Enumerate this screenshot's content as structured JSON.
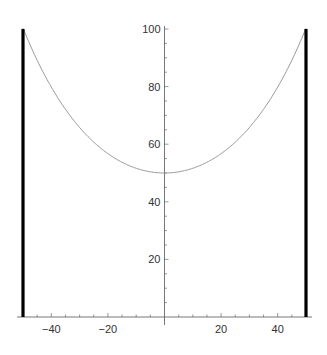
{
  "chart_data": {
    "type": "line",
    "title": "",
    "xlabel": "",
    "ylabel": "",
    "xlim": [
      -50,
      50
    ],
    "ylim": [
      0,
      100
    ],
    "grid": false,
    "x_ticks": [
      -40,
      -20,
      20,
      40
    ],
    "x_tick_labels": [
      "−40",
      "−20",
      "20",
      "40"
    ],
    "y_ticks": [
      20,
      40,
      60,
      80,
      100
    ],
    "y_tick_labels": [
      "20",
      "40",
      "60",
      "80",
      "100"
    ],
    "series": [
      {
        "name": "hanging cable (catenary)",
        "color": "#9a9a9a",
        "x": [
          -50,
          -40,
          -30,
          -25,
          -20,
          -10,
          0,
          10,
          20,
          25,
          30,
          40,
          50
        ],
        "y": [
          100,
          80.1,
          65.6,
          60.7,
          56.6,
          51.6,
          50,
          51.6,
          56.6,
          60.7,
          65.6,
          80.1,
          100
        ]
      },
      {
        "name": "left pole",
        "color": "#000000",
        "x": [
          -50,
          -50
        ],
        "y": [
          0,
          100
        ]
      },
      {
        "name": "right pole",
        "color": "#000000",
        "x": [
          50,
          50
        ],
        "y": [
          0,
          100
        ]
      }
    ],
    "catenary_param_a": 30.8,
    "minimum": {
      "x": 0,
      "y": 50
    }
  },
  "caption": "The cable hanging between two poles of equal height (cut off)"
}
